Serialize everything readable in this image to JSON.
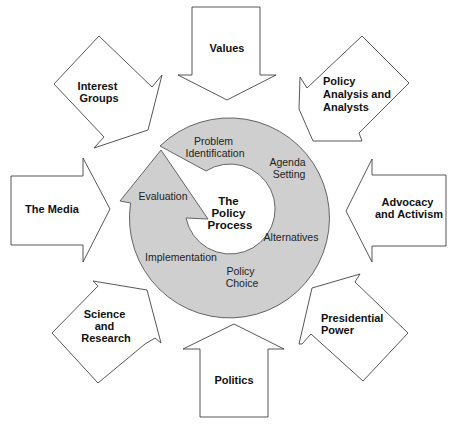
{
  "diagram": {
    "center": {
      "lines": [
        "The",
        "Policy",
        "Process"
      ]
    },
    "stages": [
      {
        "id": "problem-identification",
        "lines": [
          "Problem",
          "Identification"
        ]
      },
      {
        "id": "agenda-setting",
        "lines": [
          "Agenda",
          "Setting"
        ]
      },
      {
        "id": "alternatives",
        "lines": [
          "Alternatives"
        ]
      },
      {
        "id": "policy-choice",
        "lines": [
          "Policy",
          "Choice"
        ]
      },
      {
        "id": "implementation",
        "lines": [
          "Implementation"
        ]
      },
      {
        "id": "evaluation",
        "lines": [
          "Evaluation"
        ]
      }
    ],
    "influences": [
      {
        "id": "values",
        "direction": "down",
        "lines": [
          "Values"
        ]
      },
      {
        "id": "policy-analysis",
        "direction": "down-left",
        "lines": [
          "Policy",
          "Analysis and",
          "Analysts"
        ]
      },
      {
        "id": "advocacy",
        "direction": "left",
        "lines": [
          "Advocacy",
          "and Activism"
        ]
      },
      {
        "id": "presidential-power",
        "direction": "up-left",
        "lines": [
          "Presidential",
          "Power"
        ]
      },
      {
        "id": "politics",
        "direction": "up",
        "lines": [
          "Politics"
        ]
      },
      {
        "id": "science-research",
        "direction": "up-right",
        "lines": [
          "Science",
          "and",
          "Research"
        ]
      },
      {
        "id": "media",
        "direction": "right",
        "lines": [
          "The Media"
        ]
      },
      {
        "id": "interest-groups",
        "direction": "down-right",
        "lines": [
          "Interest",
          "Groups"
        ]
      }
    ],
    "colors": {
      "ring_fill": "#cfcfcf",
      "arrow_fill": "#ffffff",
      "stroke": "#444444",
      "text": "#111111"
    }
  }
}
